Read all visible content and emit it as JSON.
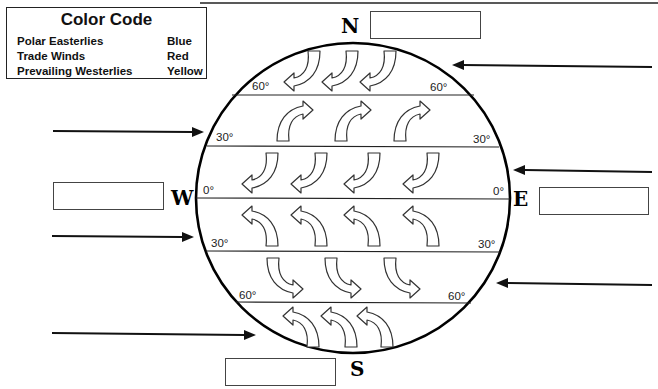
{
  "legend": {
    "title": "Color Code",
    "rows": [
      {
        "wind": "Polar Easterlies",
        "color": "Blue"
      },
      {
        "wind": "Trade Winds",
        "color": "Red"
      },
      {
        "wind": "Prevailing Westerlies",
        "color": "Yellow"
      }
    ]
  },
  "compass": {
    "north": "N",
    "south": "S",
    "east": "E",
    "west": "W"
  },
  "latitudes": {
    "n60_left": "60°",
    "n60_right": "60°",
    "n30_left": "30°",
    "n30_right": "30°",
    "eq_left": "0°",
    "eq_right": "0°",
    "s30_left": "30°",
    "s30_right": "30°",
    "s60_left": "60°",
    "s60_right": "60°"
  },
  "label_boxes": {
    "north": "",
    "south": "",
    "east": "",
    "west": ""
  },
  "colors": {
    "line": "#111111",
    "arrow_stroke": "#333333",
    "arrow_fill": "#ffffff"
  }
}
